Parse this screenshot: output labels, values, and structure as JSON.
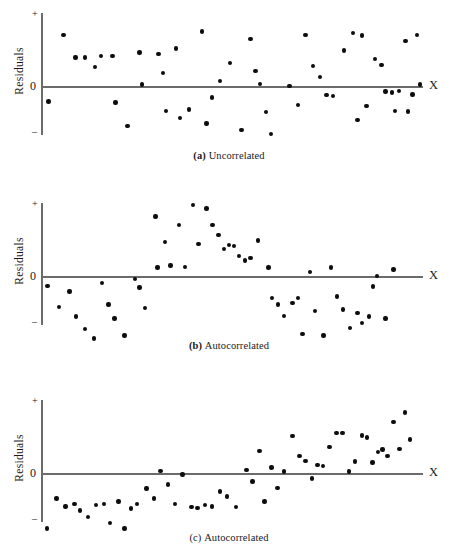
{
  "figure": {
    "background": "#ffffff",
    "dot_color": "#0d0d0d",
    "axis_color": "#6b6b6b"
  },
  "panels": [
    {
      "id": "panel-a",
      "caption_prefix": "(a)",
      "caption_text": "Uncorrelated",
      "y_axis_label": "Residuals",
      "x_axis_label": "X",
      "tick_plus": "+",
      "tick_zero": "0",
      "tick_minus": "–"
    },
    {
      "id": "panel-b",
      "caption_prefix": "(b)",
      "caption_text": "Autocorrelated",
      "y_axis_label": "Residuals",
      "x_axis_label": "X",
      "tick_plus": "+",
      "tick_zero": "0",
      "tick_minus": "–"
    },
    {
      "id": "panel-c",
      "caption_prefix": "(c)",
      "caption_text": "Autocorrelated",
      "y_axis_label": "Residuals",
      "x_axis_label": "X",
      "tick_plus": "+",
      "tick_zero": "0",
      "tick_minus": "–"
    }
  ],
  "chart_data": [
    {
      "type": "scatter",
      "title": "(a) Uncorrelated",
      "xlabel": "X",
      "ylabel": "Residuals",
      "xlim": [
        0,
        100
      ],
      "ylim": [
        -1,
        1
      ],
      "grid": false,
      "legend": null,
      "yticks": [
        "+",
        "0",
        "–"
      ],
      "series": [
        {
          "name": "residuals",
          "points": [
            [
              1.5,
              -0.22
            ],
            [
              5.4,
              0.72
            ],
            [
              8.6,
              0.4
            ],
            [
              11.2,
              0.4
            ],
            [
              13.8,
              0.27
            ],
            [
              15.4,
              0.42
            ],
            [
              18.4,
              0.42
            ],
            [
              19.2,
              -0.23
            ],
            [
              22.4,
              -0.56
            ],
            [
              25.6,
              0.47
            ],
            [
              26.2,
              0.02
            ],
            [
              30.6,
              0.45
            ],
            [
              31.8,
              0.18
            ],
            [
              32.6,
              -0.35
            ],
            [
              35.2,
              0.53
            ],
            [
              36.4,
              -0.45
            ],
            [
              38.8,
              -0.33
            ],
            [
              42.2,
              0.77
            ],
            [
              43.4,
              -0.53
            ],
            [
              44.8,
              -0.16
            ],
            [
              47.0,
              0.07
            ],
            [
              49.6,
              0.32
            ],
            [
              52.6,
              -0.62
            ],
            [
              55.0,
              0.66
            ],
            [
              56.4,
              0.21
            ],
            [
              57.6,
              0.03
            ],
            [
              59.2,
              -0.37
            ],
            [
              60.4,
              -0.68
            ],
            [
              65.4,
              0.0
            ],
            [
              67.6,
              -0.27
            ],
            [
              69.6,
              0.72
            ],
            [
              71.6,
              0.28
            ],
            [
              73.4,
              0.13
            ],
            [
              75.2,
              -0.13
            ],
            [
              77.0,
              -0.14
            ],
            [
              79.8,
              0.5
            ],
            [
              82.2,
              0.75
            ],
            [
              83.4,
              -0.48
            ],
            [
              84.6,
              0.71
            ],
            [
              85.8,
              -0.28
            ],
            [
              88.0,
              0.38
            ],
            [
              89.8,
              0.3
            ],
            [
              90.8,
              -0.08
            ],
            [
              92.6,
              -0.09
            ],
            [
              93.4,
              -0.35
            ],
            [
              94.4,
              -0.07
            ],
            [
              96.2,
              0.63
            ],
            [
              96.8,
              -0.36
            ],
            [
              98.0,
              -0.12
            ],
            [
              99.2,
              0.72
            ],
            [
              100.0,
              0.02
            ]
          ]
        }
      ]
    },
    {
      "type": "scatter",
      "title": "(b) Autocorrelated",
      "xlabel": "X",
      "ylabel": "Residuals",
      "xlim": [
        0,
        100
      ],
      "ylim": [
        -1,
        1
      ],
      "grid": false,
      "legend": null,
      "yticks": [
        "+",
        "0",
        "–"
      ],
      "series": [
        {
          "name": "residuals",
          "points": [
            [
              1.2,
              -0.14
            ],
            [
              4.2,
              -0.44
            ],
            [
              7.0,
              -0.22
            ],
            [
              8.8,
              -0.57
            ],
            [
              11.2,
              -0.75
            ],
            [
              13.6,
              -0.88
            ],
            [
              15.6,
              -0.1
            ],
            [
              17.4,
              -0.4
            ],
            [
              19.0,
              -0.6
            ],
            [
              21.6,
              -0.84
            ],
            [
              24.4,
              -0.04
            ],
            [
              25.6,
              -0.16
            ],
            [
              27.0,
              -0.45
            ],
            [
              29.8,
              0.84
            ],
            [
              30.4,
              0.12
            ],
            [
              32.4,
              0.48
            ],
            [
              33.8,
              0.15
            ],
            [
              36.0,
              0.72
            ],
            [
              37.6,
              0.13
            ],
            [
              39.8,
              1.0
            ],
            [
              41.2,
              0.45
            ],
            [
              43.4,
              0.95
            ],
            [
              45.0,
              0.72
            ],
            [
              46.6,
              0.58
            ],
            [
              48.0,
              0.38
            ],
            [
              49.4,
              0.44
            ],
            [
              50.6,
              0.42
            ],
            [
              52.0,
              0.28
            ],
            [
              53.6,
              0.22
            ],
            [
              55.0,
              0.25
            ],
            [
              57.0,
              0.5
            ],
            [
              59.8,
              0.12
            ],
            [
              60.8,
              -0.31
            ],
            [
              62.4,
              -0.4
            ],
            [
              64.0,
              -0.56
            ],
            [
              66.2,
              -0.38
            ],
            [
              67.6,
              -0.31
            ],
            [
              68.8,
              -0.82
            ],
            [
              70.8,
              0.06
            ],
            [
              72.2,
              -0.49
            ],
            [
              74.4,
              -0.84
            ],
            [
              76.4,
              0.12
            ],
            [
              78.0,
              -0.29
            ],
            [
              79.6,
              -0.47
            ],
            [
              81.4,
              -0.73
            ],
            [
              83.4,
              -0.52
            ],
            [
              84.6,
              -0.66
            ],
            [
              86.4,
              -0.57
            ],
            [
              87.6,
              -0.15
            ],
            [
              88.6,
              0.0
            ],
            [
              90.8,
              -0.6
            ],
            [
              93.0,
              0.09
            ]
          ]
        }
      ]
    },
    {
      "type": "scatter",
      "title": "(c) Autocorrelated",
      "xlabel": "X",
      "ylabel": "Residuals",
      "xlim": [
        0,
        100
      ],
      "ylim": [
        -1,
        1
      ],
      "grid": false,
      "legend": null,
      "yticks": [
        "+",
        "0",
        "–"
      ],
      "series": [
        {
          "name": "residuals",
          "points": [
            [
              1.0,
              -0.78
            ],
            [
              3.6,
              -0.36
            ],
            [
              6.0,
              -0.47
            ],
            [
              8.4,
              -0.44
            ],
            [
              9.8,
              -0.53
            ],
            [
              12.0,
              -0.62
            ],
            [
              14.0,
              -0.45
            ],
            [
              16.2,
              -0.44
            ],
            [
              17.8,
              -0.7
            ],
            [
              20.0,
              -0.4
            ],
            [
              21.6,
              -0.78
            ],
            [
              23.4,
              -0.5
            ],
            [
              25.0,
              -0.44
            ],
            [
              27.4,
              -0.22
            ],
            [
              29.4,
              -0.36
            ],
            [
              31.2,
              0.03
            ],
            [
              33.2,
              -0.16
            ],
            [
              35.0,
              -0.44
            ],
            [
              37.0,
              -0.02
            ],
            [
              39.4,
              -0.48
            ],
            [
              41.0,
              -0.49
            ],
            [
              43.0,
              -0.45
            ],
            [
              44.8,
              -0.47
            ],
            [
              47.0,
              -0.26
            ],
            [
              48.8,
              -0.33
            ],
            [
              51.2,
              -0.48
            ],
            [
              54.0,
              0.04
            ],
            [
              55.6,
              -0.12
            ],
            [
              57.4,
              0.31
            ],
            [
              58.8,
              -0.4
            ],
            [
              60.6,
              0.08
            ],
            [
              62.2,
              -0.21
            ],
            [
              64.0,
              0.02
            ],
            [
              66.2,
              0.52
            ],
            [
              68.0,
              0.24
            ],
            [
              69.6,
              0.17
            ],
            [
              71.4,
              -0.08
            ],
            [
              72.8,
              0.11
            ],
            [
              74.2,
              0.1
            ],
            [
              76.0,
              0.37
            ],
            [
              77.8,
              0.56
            ],
            [
              79.4,
              0.56
            ],
            [
              81.2,
              0.02
            ],
            [
              82.8,
              0.16
            ],
            [
              84.6,
              0.53
            ],
            [
              86.0,
              0.5
            ],
            [
              87.4,
              0.15
            ],
            [
              88.8,
              0.3
            ],
            [
              90.0,
              0.33
            ],
            [
              91.4,
              0.24
            ],
            [
              93.0,
              0.72
            ],
            [
              94.6,
              0.34
            ],
            [
              96.0,
              0.85
            ],
            [
              97.4,
              0.47
            ]
          ]
        }
      ]
    }
  ]
}
